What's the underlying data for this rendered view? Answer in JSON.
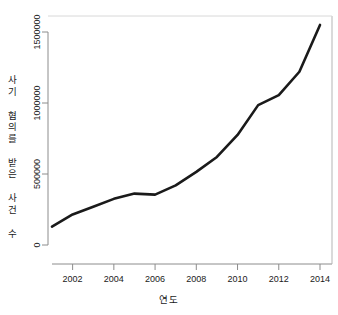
{
  "chart_data": {
    "type": "line",
    "title": "",
    "subtitle": "",
    "xlabel": "연도",
    "ylabel": "사기 혐의를 받은 사건 수",
    "x": [
      2001,
      2002,
      2003,
      2004,
      2005,
      2006,
      2007,
      2008,
      2009,
      2010,
      2011,
      2012,
      2013,
      2014
    ],
    "values": [
      130000,
      215000,
      270000,
      325000,
      362000,
      355000,
      420000,
      515000,
      620000,
      775000,
      985000,
      1055000,
      1220000,
      1550000
    ],
    "series": [
      {
        "name": "사기 혐의를 받은 사건 수",
        "values": [
          130000,
          215000,
          270000,
          325000,
          362000,
          355000,
          420000,
          515000,
          620000,
          775000,
          985000,
          1055000,
          1220000,
          1550000
        ]
      }
    ],
    "xlim": [
      2001,
      2014
    ],
    "ylim": [
      0,
      1600000
    ],
    "xticks": [
      2002,
      2004,
      2006,
      2008,
      2010,
      2012,
      2014
    ],
    "xtick_labels": [
      "2002",
      "2004",
      "2006",
      "2008",
      "2010",
      "2012",
      "2014"
    ],
    "yticks": [
      0,
      500000,
      1000000,
      1500000
    ],
    "ytick_labels": [
      "0",
      "500000",
      "1000000",
      "1500000"
    ],
    "grid": false,
    "legend": "none",
    "line_color": "#1a1a1a",
    "line_width": 2.6,
    "background_color": "#ffffff",
    "axis_color": "#8c8c8c"
  }
}
